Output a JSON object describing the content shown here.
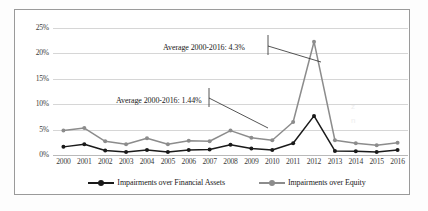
{
  "chart_data": {
    "type": "line",
    "title": "",
    "xlabel": "",
    "ylabel": "",
    "ylim": [
      0,
      25
    ],
    "ytick_labels": [
      "25%",
      "20%",
      "15%",
      "10%",
      "5%",
      "0%"
    ],
    "ytick_values": [
      25,
      20,
      15,
      10,
      5,
      0
    ],
    "grid": true,
    "legend_position": "bottom",
    "categories": [
      "2000",
      "2001",
      "2002",
      "2003",
      "2004",
      "2005",
      "2006",
      "2007",
      "2008",
      "2009",
      "2010",
      "2011",
      "2012",
      "2013",
      "2014",
      "2015",
      "2016"
    ],
    "series": [
      {
        "name": "Impairments over Financial Assets",
        "color": "#1a1a1a",
        "values": [
          1.6,
          2.1,
          0.9,
          0.6,
          1.0,
          0.6,
          1.0,
          1.1,
          2.0,
          1.3,
          1.0,
          2.3,
          7.7,
          0.8,
          0.75,
          0.6,
          1.0
        ]
      },
      {
        "name": "Impairments over Equity",
        "color": "#8c8c8c",
        "values": [
          4.8,
          5.3,
          2.7,
          2.1,
          3.3,
          2.1,
          2.8,
          2.7,
          4.8,
          3.4,
          2.9,
          6.5,
          22.3,
          2.9,
          2.3,
          1.9,
          2.4
        ]
      }
    ],
    "annotations": [
      {
        "text": "Average 2000-2016: 4.3%",
        "series": "Impairments over Equity"
      },
      {
        "text": "Average 2000-2016: 1.44%",
        "series": "Impairments over Financial Assets"
      }
    ]
  },
  "legend": {
    "items": [
      {
        "label": "Impairments over Financial Assets",
        "color": "#1a1a1a"
      },
      {
        "label": "Impairments over Equity",
        "color": "#8c8c8c"
      }
    ]
  },
  "colors": {
    "assets_series": "#1a1a1a",
    "equity_series": "#8c8c8c",
    "gridline": "#d6d6d6",
    "border": "#9a9a9a"
  }
}
